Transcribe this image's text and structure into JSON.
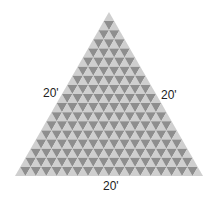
{
  "diagram": {
    "shape": "equilateral-triangle",
    "pattern": "triangular-tile-grid",
    "rows": 18,
    "colors": {
      "light": "#cfcfcf",
      "dark": "#8e8e8e"
    },
    "labels": {
      "left": "20'",
      "right": "20'",
      "bottom": "20'"
    }
  }
}
